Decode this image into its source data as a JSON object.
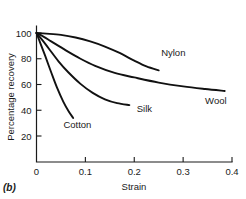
{
  "panel": {
    "label": "(b)"
  },
  "chart_data": {
    "type": "line",
    "title": "",
    "subtitle": "",
    "xlabel": "Strain",
    "ylabel": "Percentage recovery",
    "xlim": [
      0,
      0.4
    ],
    "ylim": [
      0,
      110
    ],
    "grid": false,
    "legend_position": "inline-curve-labels",
    "xticks": [
      "0",
      "0.1",
      "0.2",
      "0.3",
      "0.4"
    ],
    "xtick_values": [
      0,
      0.1,
      0.2,
      0.3,
      0.4
    ],
    "yticks": [
      "20",
      "40",
      "60",
      "80",
      "100"
    ],
    "ytick_values": [
      20,
      40,
      60,
      80,
      100
    ],
    "line_color": "#111111",
    "axis_color": "#1a1a1a",
    "series": [
      {
        "name": "Nylon",
        "label_x": 0.255,
        "label_y": 82,
        "x": [
          0.0,
          0.02,
          0.05,
          0.08,
          0.11,
          0.14,
          0.17,
          0.2,
          0.225,
          0.25
        ],
        "y": [
          100,
          99.5,
          98.5,
          96.5,
          93.5,
          89.5,
          84.5,
          78.5,
          74.0,
          71.0
        ]
      },
      {
        "name": "Wool",
        "label_x": 0.345,
        "label_y": 45,
        "x": [
          0.0,
          0.015,
          0.03,
          0.06,
          0.09,
          0.12,
          0.16,
          0.2,
          0.25,
          0.3,
          0.345,
          0.385
        ],
        "y": [
          100,
          97.0,
          93.5,
          86.5,
          80.0,
          74.5,
          69.0,
          65.5,
          61.5,
          58.5,
          56.5,
          55.0
        ]
      },
      {
        "name": "Silk",
        "label_x": 0.205,
        "label_y": 39,
        "x": [
          0.0,
          0.012,
          0.025,
          0.045,
          0.065,
          0.09,
          0.115,
          0.14,
          0.165,
          0.19
        ],
        "y": [
          100,
          94.5,
          88.0,
          78.0,
          69.5,
          60.5,
          53.5,
          48.5,
          45.5,
          44.0
        ]
      },
      {
        "name": "Cotton",
        "label_x": 0.055,
        "label_y": 26,
        "x": [
          0.0,
          0.008,
          0.018,
          0.03,
          0.042,
          0.055,
          0.066,
          0.075
        ],
        "y": [
          100,
          92.0,
          82.0,
          69.5,
          57.5,
          46.5,
          39.0,
          34.0
        ]
      }
    ]
  }
}
